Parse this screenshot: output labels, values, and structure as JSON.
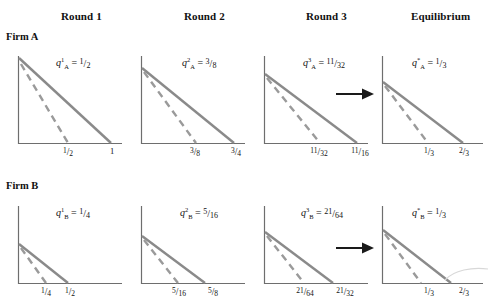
{
  "figure": {
    "colors": {
      "line_solid": "#8a8a8a",
      "line_dashed": "#9a9a9a",
      "axis": "#6e6e6e",
      "text": "#111111",
      "arrow": "#1a1a1a",
      "background": "#ffffff"
    }
  },
  "columns": [
    {
      "label": "Round 1"
    },
    {
      "label": "Round 2"
    },
    {
      "label": "Round 3"
    },
    {
      "label": "Equilibrium"
    }
  ],
  "rows": [
    {
      "label": "Firm A"
    },
    {
      "label": "Firm B"
    }
  ],
  "arrows": [
    {
      "name": "arrow-firm-a",
      "direction": "right"
    },
    {
      "name": "arrow-firm-b",
      "direction": "right"
    }
  ],
  "panels": [
    {
      "id": "a1",
      "row": "Firm A",
      "column": "Round 1",
      "equation": {
        "symbol": "q",
        "superscript": "1",
        "subscript": "A",
        "relation": "=",
        "value_num": "1",
        "value_den": "2",
        "text": "q¹ₐ = 1/2"
      },
      "ticks": [
        {
          "num": "1",
          "den": "2",
          "text": "1/2",
          "frac": true
        },
        {
          "num": "1",
          "den": "",
          "text": "1",
          "frac": false
        }
      ],
      "solid_end_tick": 1,
      "dashed_end_tick": 0,
      "intercept_ratio": 1.0
    },
    {
      "id": "a2",
      "row": "Firm A",
      "column": "Round 2",
      "equation": {
        "symbol": "q",
        "superscript": "2",
        "subscript": "A",
        "relation": "=",
        "value_num": "3",
        "value_den": "8",
        "text": "q²ₐ = 3/8"
      },
      "ticks": [
        {
          "num": "3",
          "den": "8",
          "text": "3/8",
          "frac": true
        },
        {
          "num": "3",
          "den": "4",
          "text": "3/4",
          "frac": true
        }
      ],
      "solid_end_tick": 1,
      "dashed_end_tick": 0,
      "intercept_ratio": 0.84
    },
    {
      "id": "a3",
      "row": "Firm A",
      "column": "Round 3",
      "equation": {
        "symbol": "q",
        "superscript": "3",
        "subscript": "A",
        "relation": "=",
        "value_num": "11",
        "value_den": "32",
        "text": "q³ₐ = 11/32"
      },
      "ticks": [
        {
          "num": "11",
          "den": "32",
          "text": "11/32",
          "frac": true
        },
        {
          "num": "11",
          "den": "16",
          "text": "11/16",
          "frac": true
        }
      ],
      "solid_end_tick": 1,
      "dashed_end_tick": 0,
      "intercept_ratio": 0.78
    },
    {
      "id": "a4",
      "row": "Firm A",
      "column": "Equilibrium",
      "equation": {
        "symbol": "q",
        "superscript": "*",
        "subscript": "A",
        "relation": "=",
        "value_num": "1",
        "value_den": "3",
        "text": "q*ₐ = 1/3"
      },
      "ticks": [
        {
          "num": "1",
          "den": "3",
          "text": "1/3",
          "frac": true
        },
        {
          "num": "2",
          "den": "3",
          "text": "2/3",
          "frac": true
        }
      ],
      "solid_end_tick": 1,
      "dashed_end_tick": 0,
      "intercept_ratio": 0.72
    },
    {
      "id": "b1",
      "row": "Firm B",
      "column": "Round 1",
      "equation": {
        "symbol": "q",
        "superscript": "1",
        "subscript": "B",
        "relation": "=",
        "value_num": "1",
        "value_den": "4",
        "text": "q¹ʙ = 1/4"
      },
      "ticks": [
        {
          "num": "1",
          "den": "4",
          "text": "1/4",
          "frac": true
        },
        {
          "num": "1",
          "den": "2",
          "text": "1/2",
          "frac": true
        }
      ],
      "solid_end_tick": 1,
      "dashed_end_tick": 0,
      "intercept_ratio": 0.5
    },
    {
      "id": "b2",
      "row": "Firm B",
      "column": "Round 2",
      "equation": {
        "symbol": "q",
        "superscript": "2",
        "subscript": "B",
        "relation": "=",
        "value_num": "5",
        "value_den": "16",
        "text": "q²ʙ = 5/16"
      },
      "ticks": [
        {
          "num": "5",
          "den": "16",
          "text": "5/16",
          "frac": true
        },
        {
          "num": "5",
          "den": "8",
          "text": "5/8",
          "frac": true
        }
      ],
      "solid_end_tick": 1,
      "dashed_end_tick": 0,
      "intercept_ratio": 0.62
    },
    {
      "id": "b3",
      "row": "Firm B",
      "column": "Round 3",
      "equation": {
        "symbol": "q",
        "superscript": "3",
        "subscript": "B",
        "relation": "=",
        "value_num": "21",
        "value_den": "64",
        "text": "q³ʙ = 21/64"
      },
      "ticks": [
        {
          "num": "21",
          "den": "64",
          "text": "21/64",
          "frac": true
        },
        {
          "num": "21",
          "den": "32",
          "text": "21/32",
          "frac": true
        }
      ],
      "solid_end_tick": 1,
      "dashed_end_tick": 0,
      "intercept_ratio": 0.66
    },
    {
      "id": "b4",
      "row": "Firm B",
      "column": "Equilibrium",
      "equation": {
        "symbol": "q",
        "superscript": "*",
        "subscript": "B",
        "relation": "=",
        "value_num": "1",
        "value_den": "3",
        "text": "q*ʙ = 1/3"
      },
      "ticks": [
        {
          "num": "1",
          "den": "3",
          "text": "1/3",
          "frac": true
        },
        {
          "num": "2",
          "den": "3",
          "text": "2/3",
          "frac": true
        }
      ],
      "solid_end_tick": 1,
      "dashed_end_tick": 0,
      "intercept_ratio": 0.68
    }
  ]
}
